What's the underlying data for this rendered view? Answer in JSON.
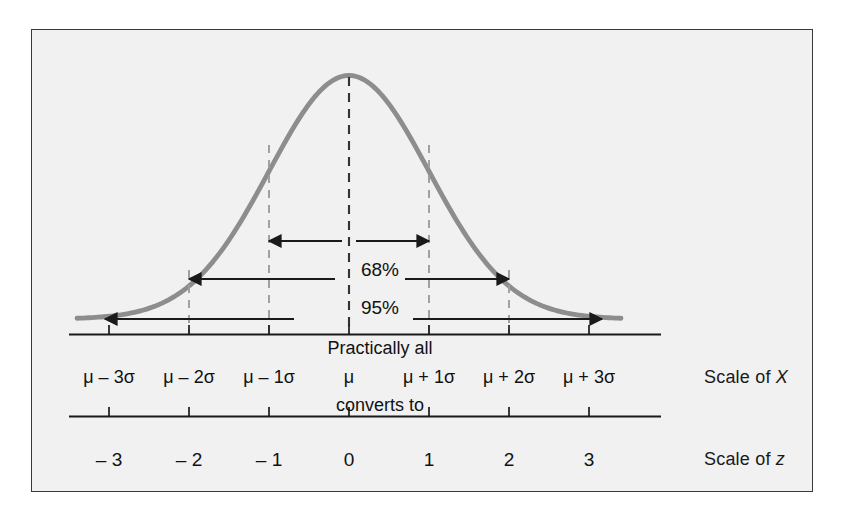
{
  "figure": {
    "background_color": "#f1f1f1",
    "border_color": "#3a3a3a",
    "curve_color": "#8d8d8d",
    "axis_color": "#1a1a1a",
    "dash_center_color": "#333333",
    "dash_sigma_color": "#9a9a9a"
  },
  "axes": {
    "x_caption": "Scale of ",
    "x_caption_symbol": "X",
    "z_caption": "Scale of ",
    "z_caption_symbol": "z",
    "converts_to": "converts to",
    "x_tick_labels": [
      "μ – 3σ",
      "μ – 2σ",
      "μ – 1σ",
      "μ",
      "μ + 1σ",
      "μ + 2σ",
      "μ + 3σ"
    ],
    "z_tick_labels": [
      "– 3",
      "– 2",
      "– 1",
      "0",
      "1",
      "2",
      "3"
    ]
  },
  "annotations": {
    "band_68": "68%",
    "band_95": "95%",
    "band_all": "Practically all"
  },
  "chart_data": {
    "type": "line",
    "title": "",
    "subtitle": "",
    "xlabel": "Scale of X",
    "ylabel": "",
    "grid": false,
    "legend": null,
    "curve": "standard normal probability density (bell curve)",
    "x": [
      -3,
      -2,
      -1,
      0,
      1,
      2,
      3
    ],
    "x_tick_labels": [
      "μ – 3σ",
      "μ – 2σ",
      "μ – 1σ",
      "μ",
      "μ + 1σ",
      "μ + 2σ",
      "μ + 3σ"
    ],
    "secondary_axis": {
      "label": "Scale of z",
      "tick_labels": [
        "– 3",
        "– 2",
        "– 1",
        "0",
        "1",
        "2",
        "3"
      ],
      "values": [
        -3,
        -2,
        -1,
        0,
        1,
        2,
        3
      ]
    },
    "xlim": [
      -3.4,
      3.4
    ],
    "ylim": [
      0,
      1.08
    ],
    "values": [
      0.0111,
      0.1353,
      0.6065,
      1.0,
      0.6065,
      0.1353,
      0.0111
    ],
    "annotations": [
      {
        "label": "68%",
        "from": -1,
        "to": 1,
        "kind": "double-arrow"
      },
      {
        "label": "95%",
        "from": -2,
        "to": 2,
        "kind": "double-arrow"
      },
      {
        "label": "Practically all",
        "from": -3,
        "to": 3,
        "kind": "double-arrow"
      }
    ],
    "reference_lines": [
      {
        "at": -2,
        "style": "dashed"
      },
      {
        "at": -1,
        "style": "dashed"
      },
      {
        "at": 0,
        "style": "dashed"
      },
      {
        "at": 1,
        "style": "dashed"
      },
      {
        "at": 2,
        "style": "dashed"
      }
    ]
  }
}
